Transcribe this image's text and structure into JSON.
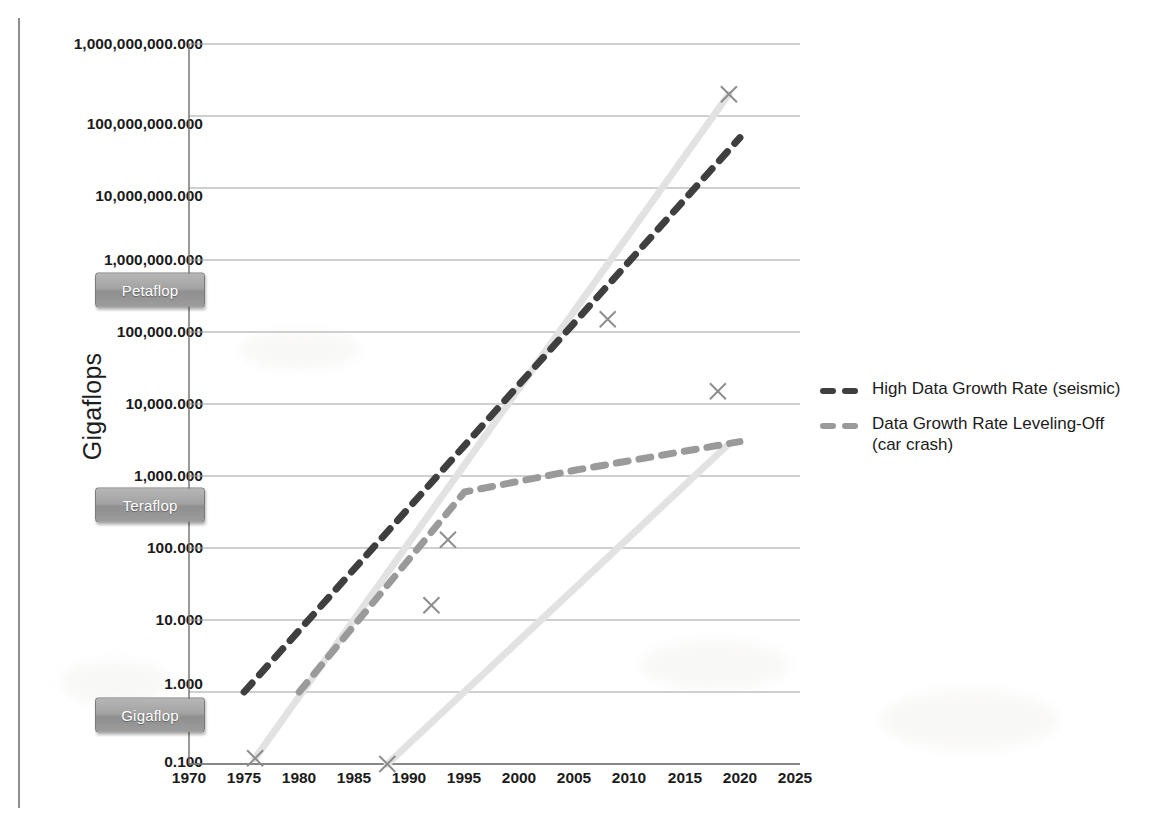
{
  "chart_data": {
    "type": "line",
    "title": "",
    "xlabel": "",
    "ylabel": "Gigaflops",
    "yscale": "log",
    "ylim": [
      0.1,
      1000000000
    ],
    "xlim": [
      1970,
      2025
    ],
    "grid": true,
    "legend_position": "right",
    "y_ticks": [
      "1,000,000,000.000",
      "100,000,000.000",
      "10,000,000.000",
      "1,000,000.000",
      "100,000.000",
      "10,000.000",
      "1,000.000",
      "100.000",
      "10.000",
      "1.000",
      "0.100"
    ],
    "y_tick_values": [
      1000000000,
      100000000,
      10000000,
      1000000,
      100000,
      10000,
      1000,
      100,
      10,
      1,
      0.1
    ],
    "x_ticks": [
      "1970",
      "1975",
      "1980",
      "1985",
      "1990",
      "1995",
      "2000",
      "2005",
      "2010",
      "2015",
      "2020",
      "2025"
    ],
    "x_tick_values": [
      1970,
      1975,
      1980,
      1985,
      1990,
      1995,
      2000,
      2005,
      2010,
      2015,
      2020,
      2025
    ],
    "series": [
      {
        "name": "High Data Growth Rate (seismic)",
        "style": "dashed",
        "color": "#3f3f3f",
        "x": [
          1975,
          2020
        ],
        "values": [
          1.0,
          50000000.0
        ]
      },
      {
        "name": "Data Growth Rate Leveling-Off (car crash)",
        "style": "dashed",
        "color": "#9a9a9a",
        "x": [
          1980,
          1995,
          2005,
          2020
        ],
        "values": [
          1.0,
          600.0,
          1200.0,
          3000.0
        ]
      },
      {
        "name": "Supercomputer performance (upper)",
        "style": "solid",
        "color": "#e2e2e2",
        "x": [
          1976,
          2019
        ],
        "values": [
          0.12,
          200000000.0
        ]
      },
      {
        "name": "Supercomputer performance (lower)",
        "style": "solid",
        "color": "#e2e2e2",
        "x": [
          1988,
          2019
        ],
        "values": [
          0.1,
          2800.0
        ]
      }
    ],
    "markers": [
      {
        "label": "x-marker",
        "x": 1976,
        "y": 0.12
      },
      {
        "label": "x-marker",
        "x": 1988,
        "y": 0.1
      },
      {
        "label": "x-marker",
        "x": 1992,
        "y": 16
      },
      {
        "label": "x-marker",
        "x": 1993.5,
        "y": 130
      },
      {
        "label": "x-marker",
        "x": 2008,
        "y": 150000
      },
      {
        "label": "x-marker",
        "x": 2018,
        "y": 15000
      },
      {
        "label": "x-marker",
        "x": 2019,
        "y": 200000000
      }
    ],
    "thresholds": [
      {
        "label": "Petaflop",
        "y": 1000000
      },
      {
        "label": "Teraflop",
        "y": 1000
      },
      {
        "label": "Gigaflop",
        "y": 1
      }
    ]
  },
  "legend": {
    "items": [
      {
        "label": "High Data Growth Rate (seismic)",
        "color": "#3f3f3f"
      },
      {
        "label": "Data Growth Rate Leveling-Off",
        "label2": "(car crash)",
        "color": "#9a9a9a"
      }
    ]
  },
  "colors": {
    "dark_series": "#3f3f3f",
    "mid_series": "#9a9a9a",
    "light_series": "#e2e2e2",
    "grid": "#a0a0a0",
    "axis": "#6f6f6f",
    "text": "#1b1b1b",
    "pill_text": "#ffffff"
  }
}
